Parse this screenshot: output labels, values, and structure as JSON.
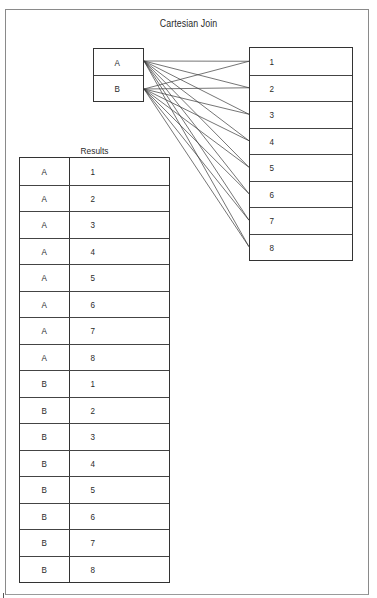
{
  "diagram": {
    "title": "Cartesian Join",
    "left_table": {
      "rows": [
        "A",
        "B"
      ]
    },
    "right_table": {
      "rows": [
        "1",
        "2",
        "3",
        "4",
        "5",
        "6",
        "7",
        "8"
      ]
    },
    "connections": "every row of left table connects to every row of right table (2 x 8 = 16 lines)",
    "results": {
      "title": "Results",
      "columns": [
        "letter",
        "number"
      ],
      "rows": [
        [
          "A",
          "1"
        ],
        [
          "A",
          "2"
        ],
        [
          "A",
          "3"
        ],
        [
          "A",
          "4"
        ],
        [
          "A",
          "5"
        ],
        [
          "A",
          "6"
        ],
        [
          "A",
          "7"
        ],
        [
          "A",
          "8"
        ],
        [
          "B",
          "1"
        ],
        [
          "B",
          "2"
        ],
        [
          "B",
          "3"
        ],
        [
          "B",
          "4"
        ],
        [
          "B",
          "5"
        ],
        [
          "B",
          "6"
        ],
        [
          "B",
          "7"
        ],
        [
          "B",
          "8"
        ]
      ]
    }
  },
  "colors": {
    "line": "#3a3a3a",
    "border": "#333333",
    "frame": "#8a8a8a",
    "background": "#ffffff"
  }
}
